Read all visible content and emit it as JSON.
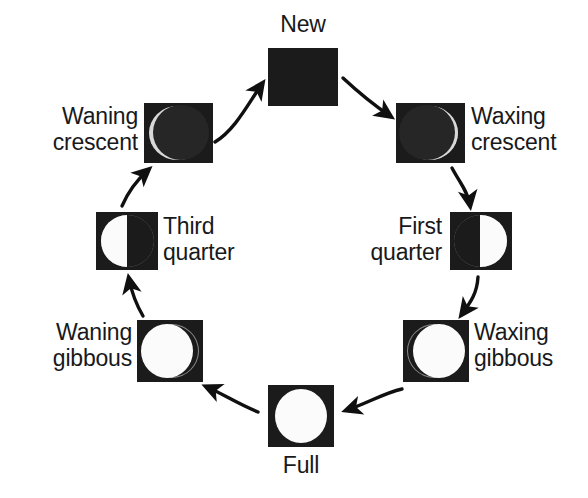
{
  "diagram": {
    "title_text": "Moon phases cycle",
    "background_color": "#ffffff",
    "tile_color": "#1b1b1b",
    "lit_color": "#fbfbfb",
    "rim_color": "#8a8a8a",
    "arrow_color": "#101010",
    "direction": "clockwise",
    "phase_count": 8
  },
  "phases": [
    {
      "id": "new",
      "label": "New",
      "label_align": "center",
      "illumination_percent": 0,
      "appearance": "fully-dark-square",
      "position": {
        "tile_x": 268,
        "tile_y": 48,
        "tile_w": 70,
        "tile_h": 58
      },
      "label_position": {
        "x": 258,
        "y": 12,
        "w": 90
      }
    },
    {
      "id": "waxing-crescent",
      "label": "Waxing\ncrescent",
      "label_align": "left",
      "illumination_percent": 8,
      "appearance": "dark-disc-thin-bright-rim-right",
      "position": {
        "tile_x": 396,
        "tile_y": 103,
        "tile_w": 69,
        "tile_h": 60
      },
      "label_position": {
        "x": 471,
        "y": 104,
        "w": 112
      }
    },
    {
      "id": "first-quarter",
      "label": "First\nquarter",
      "label_align": "right",
      "illumination_percent": 50,
      "appearance": "right-half-lit",
      "position": {
        "tile_x": 450,
        "tile_y": 212,
        "tile_w": 62,
        "tile_h": 58
      },
      "label_position": {
        "x": 336,
        "y": 214,
        "w": 106
      }
    },
    {
      "id": "waxing-gibbous",
      "label": "Waxing\ngibbous",
      "label_align": "left",
      "illumination_percent": 88,
      "appearance": "mostly-lit-dark-crescent-left",
      "position": {
        "tile_x": 403,
        "tile_y": 320,
        "tile_w": 66,
        "tile_h": 62
      },
      "label_position": {
        "x": 474,
        "y": 320,
        "w": 110
      }
    },
    {
      "id": "full",
      "label": "Full",
      "label_align": "center",
      "illumination_percent": 100,
      "appearance": "full-bright-disc",
      "position": {
        "tile_x": 268,
        "tile_y": 385,
        "tile_w": 66,
        "tile_h": 62
      },
      "label_position": {
        "x": 258,
        "y": 453,
        "w": 86
      }
    },
    {
      "id": "waning-gibbous",
      "label": "Waning\ngibbous",
      "label_align": "right",
      "illumination_percent": 88,
      "appearance": "mostly-lit-dark-crescent-right",
      "position": {
        "tile_x": 137,
        "tile_y": 320,
        "tile_w": 66,
        "tile_h": 62
      },
      "label_position": {
        "x": 16,
        "y": 320,
        "w": 116
      }
    },
    {
      "id": "third-quarter",
      "label": "Third\nquarter",
      "label_align": "left",
      "illumination_percent": 50,
      "appearance": "left-half-lit",
      "position": {
        "tile_x": 96,
        "tile_y": 212,
        "tile_w": 62,
        "tile_h": 58
      },
      "label_position": {
        "x": 163,
        "y": 214,
        "w": 110
      }
    },
    {
      "id": "waning-crescent",
      "label": "Waning\ncrescent",
      "label_align": "right",
      "illumination_percent": 8,
      "appearance": "dark-disc-thin-bright-rim-left",
      "position": {
        "tile_x": 144,
        "tile_y": 103,
        "tile_w": 69,
        "tile_h": 60
      },
      "label_position": {
        "x": 22,
        "y": 104,
        "w": 116
      }
    }
  ],
  "arrows": [
    {
      "id": "arrow-waning-crescent-to-new",
      "from": "waning-crescent",
      "to": "new"
    },
    {
      "id": "arrow-new-to-waxing-crescent",
      "from": "new",
      "to": "waxing-crescent"
    },
    {
      "id": "arrow-waxing-crescent-to-first-quarter",
      "from": "waxing-crescent",
      "to": "first-quarter"
    },
    {
      "id": "arrow-first-quarter-to-waxing-gibbous",
      "from": "first-quarter",
      "to": "waxing-gibbous"
    },
    {
      "id": "arrow-waxing-gibbous-to-full",
      "from": "waxing-gibbous",
      "to": "full"
    },
    {
      "id": "arrow-full-to-waning-gibbous",
      "from": "full",
      "to": "waning-gibbous"
    },
    {
      "id": "arrow-waning-gibbous-to-third-quarter",
      "from": "waning-gibbous",
      "to": "third-quarter"
    },
    {
      "id": "arrow-third-quarter-to-waning-crescent",
      "from": "third-quarter",
      "to": "waning-crescent"
    }
  ]
}
